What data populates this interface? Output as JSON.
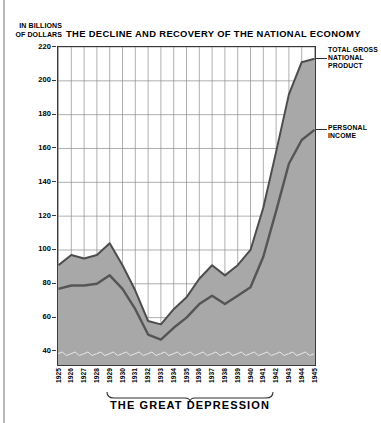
{
  "figure": {
    "unit_caption_line1": "IN BILLIONS",
    "unit_caption_line2": "OF DOLLARS",
    "depression_caption": "THE GREAT DEPRESSION",
    "label_gnp_line1": "TOTAL GROSS",
    "label_gnp_line2": "NATIONAL",
    "label_gnp_line3": "PRODUCT",
    "label_pi_line1": "PERSONAL",
    "label_pi_line2": "INCOME"
  },
  "colors": {
    "band_fill": "#a8a8a8",
    "line_gnp": "#4d4d4d",
    "line_pi": "#555555",
    "axis": "#3a3a3a",
    "grid": "#8d8d8d",
    "text": "#000000"
  },
  "chart_data": {
    "type": "area",
    "title": "THE DECLINE AND RECOVERY OF THE NATIONAL ECONOMY",
    "xlabel": "",
    "ylabel": "IN BILLIONS OF DOLLARS",
    "ylim": [
      32,
      220
    ],
    "xlim": [
      "1925",
      "1945"
    ],
    "grid": true,
    "legend_position": "right-inline",
    "yticks": [
      220,
      200,
      180,
      160,
      140,
      120,
      100,
      80,
      60,
      40
    ],
    "categories": [
      "1925",
      "1926",
      "1927",
      "1928",
      "1929",
      "1930",
      "1931",
      "1932",
      "1933",
      "1934",
      "1935",
      "1936",
      "1937",
      "1938",
      "1939",
      "1940",
      "1941",
      "1942",
      "1943",
      "1944",
      "1945"
    ],
    "series": [
      {
        "name": "TOTAL GROSS NATIONAL PRODUCT",
        "values": [
          91,
          97,
          95,
          97,
          104,
          91,
          76,
          58,
          56,
          65,
          72,
          83,
          91,
          85,
          91,
          100,
          125,
          158,
          192,
          211,
          213
        ]
      },
      {
        "name": "PERSONAL INCOME",
        "values": [
          77,
          79,
          79,
          80,
          85,
          77,
          65,
          50,
          47,
          54,
          60,
          68,
          73,
          68,
          73,
          78,
          96,
          123,
          151,
          165,
          171
        ]
      }
    ],
    "annotations": [
      {
        "text": "THE GREAT DEPRESSION",
        "span": [
          "1929",
          "1939"
        ],
        "position": "below-axis"
      }
    ]
  }
}
